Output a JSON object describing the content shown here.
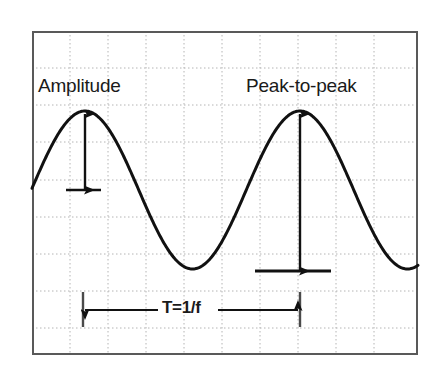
{
  "figure": {
    "title_visible": false,
    "background_color": "#ffffff",
    "frame": {
      "name": "oscilloscope-screen-frame",
      "x": 32,
      "y": 31,
      "width": 386,
      "height": 324,
      "border_color": "#595959",
      "border_width": 2
    },
    "grid": {
      "visible": true,
      "style": "dotted",
      "color": "#b4b4b4",
      "vertical_lines_x": [
        70,
        108,
        146,
        184,
        222,
        260,
        298,
        336,
        374
      ],
      "horizontal_lines_y": [
        68,
        105,
        142,
        180,
        217,
        254,
        291,
        328
      ]
    }
  },
  "annotations": {
    "amplitude": {
      "label": "Amplitude",
      "icon": "vertical-double-arrow-icon",
      "arrow_x": 85,
      "arrow_top_y": 114,
      "arrow_bottom_y": 190,
      "baseline_x1": 66,
      "baseline_x2": 101,
      "baseline_y": 190,
      "color": "#111111"
    },
    "peak_to_peak": {
      "label": "Peak-to-peak",
      "icon": "vertical-double-arrow-icon",
      "arrow_x": 300,
      "arrow_top_y": 114,
      "arrow_bottom_y": 271,
      "baseline_x1": 255,
      "baseline_x2": 331,
      "baseline_y": 271,
      "color": "#111111"
    },
    "period": {
      "label": "T=1/f",
      "icon": "horizontal-double-arrow-icon",
      "arrow_y": 310,
      "arrow_x1": 83,
      "arrow_x2": 300,
      "tick_left_x": 83,
      "tick_right_x": 300,
      "tick_top_y": 292,
      "tick_bottom_y": 327,
      "color": "#111111"
    }
  },
  "chart_data": {
    "type": "line",
    "title": "",
    "xlabel": "",
    "ylabel": "",
    "grid": true,
    "legend_position": "none",
    "xlim": [
      32,
      418
    ],
    "ylim": [
      112,
      271
    ],
    "annotations": [
      "Amplitude",
      "Peak-to-peak",
      "T=1/f"
    ],
    "series": [
      {
        "name": "sine-waveform",
        "color": "#111111",
        "line_width": 3,
        "description": "Sinusoid, centerline y=190 px, amplitude 79 px, period 215 px",
        "waveform": {
          "centerline_y": 190,
          "amplitude_px": 79,
          "period_px": 215,
          "peak_y": 112,
          "trough_y": 271,
          "peaks_x": [
            85,
            300
          ],
          "troughs_x": [
            190,
            397
          ],
          "start_x": 32,
          "start_y": 190,
          "end_x": 418
        },
        "points": [
          [
            32,
            190
          ],
          [
            42,
            168
          ],
          [
            53,
            146
          ],
          [
            64,
            128
          ],
          [
            75,
            116
          ],
          [
            85,
            112
          ],
          [
            96,
            116
          ],
          [
            107,
            128
          ],
          [
            118,
            146
          ],
          [
            128,
            168
          ],
          [
            139,
            190
          ],
          [
            150,
            212
          ],
          [
            160,
            234
          ],
          [
            171,
            252
          ],
          [
            182,
            265
          ],
          [
            190,
            271
          ],
          [
            203,
            267
          ],
          [
            214,
            256
          ],
          [
            225,
            239
          ],
          [
            236,
            217
          ],
          [
            246,
            194
          ],
          [
            257,
            171
          ],
          [
            268,
            149
          ],
          [
            279,
            130
          ],
          [
            290,
            117
          ],
          [
            300,
            112
          ],
          [
            311,
            116
          ],
          [
            322,
            128
          ],
          [
            333,
            146
          ],
          [
            343,
            168
          ],
          [
            354,
            190
          ],
          [
            365,
            212
          ],
          [
            376,
            234
          ],
          [
            386,
            252
          ],
          [
            397,
            268
          ],
          [
            408,
            262
          ],
          [
            418,
            248
          ]
        ]
      }
    ]
  }
}
